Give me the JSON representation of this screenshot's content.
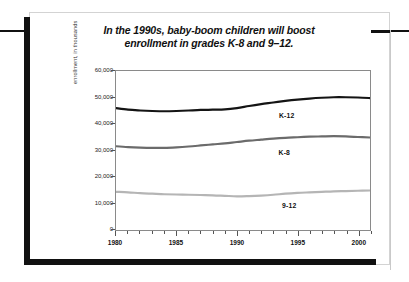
{
  "page": {
    "title_line_1": "In the 1990s, baby-boom children will boost",
    "title_line_2": "enrollment in grades K-8 and 9–12."
  },
  "chart_data": {
    "type": "line",
    "title": "In the 1990s, baby-boom children will boost enrollment in grades K-8 and 9–12.",
    "xlabel": "",
    "ylabel": "enrollment, in thousands",
    "xlim": [
      1980,
      2001
    ],
    "ylim": [
      0,
      60000
    ],
    "grid": false,
    "legend_position": "inline-labels",
    "x_tick_labels": [
      "1980",
      "1985",
      "1990",
      "1995",
      "2000"
    ],
    "x_tick_values": [
      1980,
      1985,
      1990,
      1995,
      2000
    ],
    "x_minor_tick_interval": 1,
    "y_tick_labels": [
      "0",
      "10,000",
      "20,000",
      "30,000",
      "40,000",
      "50,000",
      "60,000"
    ],
    "y_tick_values": [
      0,
      10000,
      20000,
      30000,
      40000,
      50000,
      60000
    ],
    "x": [
      1980,
      1981,
      1982,
      1983,
      1984,
      1985,
      1986,
      1987,
      1988,
      1989,
      1990,
      1991,
      1992,
      1993,
      1994,
      1995,
      1996,
      1997,
      1998,
      1999,
      2000,
      2001
    ],
    "series": [
      {
        "name": "K-12",
        "color": "#141414",
        "label_x": 1994.2,
        "label_y": 43000,
        "values": [
          46000,
          45400,
          45100,
          44900,
          44800,
          44900,
          45100,
          45300,
          45400,
          45500,
          46000,
          46800,
          47500,
          48100,
          48700,
          49200,
          49600,
          49900,
          50100,
          50100,
          50000,
          49800
        ]
      },
      {
        "name": "K-8",
        "color": "#6b6b6b",
        "label_x": 1994.0,
        "label_y": 29000,
        "values": [
          31600,
          31300,
          31100,
          31000,
          31000,
          31200,
          31500,
          31900,
          32300,
          32700,
          33200,
          33700,
          34100,
          34500,
          34800,
          35000,
          35200,
          35300,
          35400,
          35300,
          35100,
          34900
        ]
      },
      {
        "name": "9-12",
        "color": "#b5b5b5",
        "label_x": 1994.4,
        "label_y": 9000,
        "values": [
          14400,
          14200,
          13900,
          13700,
          13500,
          13400,
          13300,
          13200,
          13100,
          12900,
          12700,
          12800,
          13000,
          13300,
          13700,
          14000,
          14200,
          14400,
          14600,
          14700,
          14800,
          14900
        ]
      }
    ]
  }
}
